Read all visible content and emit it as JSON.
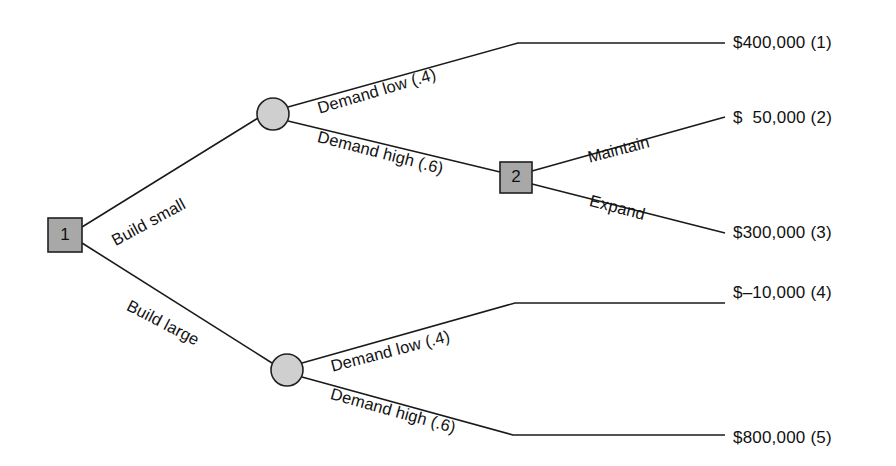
{
  "diagram": {
    "type": "decision-tree",
    "colors": {
      "decision_node_fill": "#a8a8a8",
      "chance_node_fill": "#cfcfcf",
      "line": "#1a1a1a",
      "background": "#ffffff",
      "text": "#111111"
    },
    "nodes": [
      {
        "id": "1",
        "kind": "decision",
        "label": "1",
        "x": 65,
        "y": 235,
        "w": 34,
        "h": 34
      },
      {
        "id": "c1",
        "kind": "chance",
        "label": "",
        "x": 273,
        "y": 114,
        "r": 16
      },
      {
        "id": "2",
        "kind": "decision",
        "label": "2",
        "x": 516,
        "y": 177,
        "w": 32,
        "h": 31
      },
      {
        "id": "c2",
        "kind": "chance",
        "label": "",
        "x": 287,
        "y": 370,
        "r": 16
      }
    ],
    "branch_labels": [
      {
        "id": "build-small",
        "text": "Build small",
        "x": 113,
        "y": 232,
        "rotate": -28.5
      },
      {
        "id": "build-large",
        "text": "Build large",
        "x": 128,
        "y": 295,
        "rotate": 27.5
      },
      {
        "id": "demand-low-upper",
        "text": "Demand low (.4)",
        "x": 318,
        "y": 99,
        "rotate": -16.5
      },
      {
        "id": "demand-high-upper",
        "text": "Demand high (.6)",
        "x": 318,
        "y": 127,
        "rotate": 14.5
      },
      {
        "id": "maintain",
        "text": "Maintain",
        "x": 588,
        "y": 148,
        "rotate": -14.5
      },
      {
        "id": "expand",
        "text": "Expand",
        "x": 590,
        "y": 191,
        "rotate": 14.5
      },
      {
        "id": "demand-low-lower",
        "text": "Demand low (.4)",
        "x": 331,
        "y": 357,
        "rotate": -14.5
      },
      {
        "id": "demand-high-lower",
        "text": "Demand high (.6)",
        "x": 331,
        "y": 384,
        "rotate": 15.5
      }
    ],
    "payoffs": [
      {
        "id": "payoff-1",
        "text": "$400,000 (1)",
        "x": 733,
        "y": 33,
        "outcome": 1,
        "value": 400000
      },
      {
        "id": "payoff-2",
        "text": "$  50,000 (2)",
        "x": 733,
        "y": 108,
        "outcome": 2,
        "value": 50000
      },
      {
        "id": "payoff-3",
        "text": "$300,000 (3)",
        "x": 733,
        "y": 223,
        "outcome": 3,
        "value": 300000
      },
      {
        "id": "payoff-4",
        "text": "$–10,000 (4)",
        "x": 733,
        "y": 283,
        "outcome": 4,
        "value": -10000
      },
      {
        "id": "payoff-5",
        "text": "$800,000 (5)",
        "x": 733,
        "y": 428,
        "outcome": 5,
        "value": 800000
      }
    ],
    "edges": [
      {
        "id": "edge-build-small",
        "from": "1",
        "to": "c1",
        "points": "82,227 258,118"
      },
      {
        "id": "edge-build-large",
        "from": "1",
        "to": "c2",
        "points": "82,243 272,363"
      },
      {
        "id": "edge-demand-low-upper",
        "from": "c1",
        "to": "payoff-1",
        "points": "288,107 518,43 725,43"
      },
      {
        "id": "edge-demand-high-upper",
        "from": "c1",
        "to": "2",
        "points": "288,121 500,172"
      },
      {
        "id": "edge-maintain",
        "from": "2",
        "to": "payoff-2",
        "points": "532,171 725,117"
      },
      {
        "id": "edge-expand",
        "from": "2",
        "to": "payoff-3",
        "points": "532,184 725,233"
      },
      {
        "id": "edge-demand-low-lower",
        "from": "c2",
        "to": "payoff-4",
        "points": "302,363 515,303 725,303"
      },
      {
        "id": "edge-demand-high-lower",
        "from": "c2",
        "to": "payoff-5",
        "points": "302,377 513,435 725,435"
      }
    ]
  }
}
